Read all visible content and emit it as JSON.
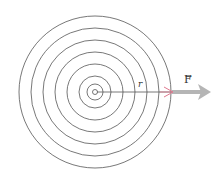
{
  "diagram": {
    "center": {
      "x": 95,
      "y": 92
    },
    "circle_radii": [
      76,
      64,
      52,
      40,
      28,
      16,
      8,
      2.5
    ],
    "circle_color": "#555555",
    "radius_line": {
      "x1": 95,
      "y1": 92,
      "x2": 172,
      "y2": 92,
      "color": "#555555"
    },
    "pink_arrow": {
      "color": "#e07a90"
    },
    "field_arrow": {
      "color": "#b5b5b5",
      "x1": 172,
      "x2": 210,
      "y": 92
    },
    "labels": {
      "radius": "r",
      "field": "F",
      "field_vector_mark": "→"
    }
  }
}
